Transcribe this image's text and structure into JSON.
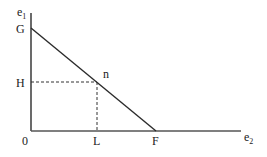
{
  "diagram": {
    "title": "",
    "axes": {
      "y_label": "e",
      "y_label_sub": "1",
      "x_label": "e",
      "x_label_sub": "2"
    },
    "points": {
      "origin": "0",
      "G": "G",
      "H": "H",
      "L": "L",
      "F": "F",
      "n": "n"
    },
    "colors": {
      "line": "#2b2b2b",
      "dashed": "#333333",
      "text": "#222222",
      "background": "#ffffff"
    }
  }
}
